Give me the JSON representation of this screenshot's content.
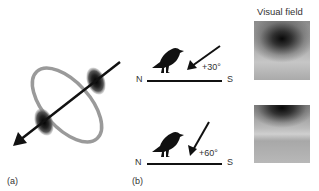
{
  "panel_a": {
    "label": "(a)",
    "description": "Ring with two dark lobes and a diagonal arrow through its axis"
  },
  "panel_b": {
    "label": "(b)",
    "rows": [
      {
        "north": "N",
        "south": "S",
        "angle": "+30°",
        "icon": "bird-icon"
      },
      {
        "north": "N",
        "south": "S",
        "angle": "+60°",
        "icon": "bird-icon"
      }
    ]
  },
  "visual_field": {
    "title": "Visual field",
    "panels": [
      {
        "name": "visual-field-30"
      },
      {
        "name": "visual-field-60"
      }
    ]
  },
  "colors": {
    "ring": "#9a9a9a",
    "lobe": "#1a1a1a",
    "arrow": "#111111",
    "text": "#333333"
  }
}
